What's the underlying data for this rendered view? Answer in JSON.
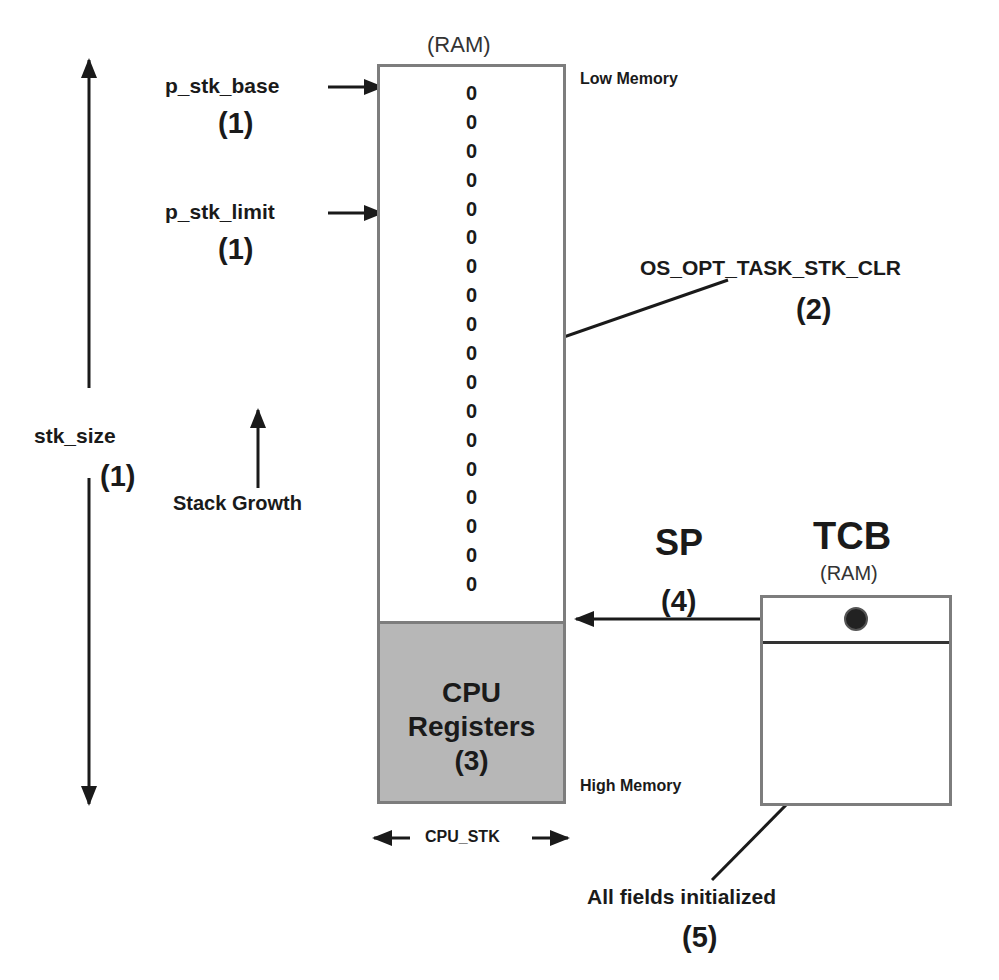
{
  "stack": {
    "ram_label": "(RAM)",
    "low_memory_label": "Low Memory",
    "high_memory_label": "High Memory",
    "zeros": [
      "0",
      "0",
      "0",
      "0",
      "0",
      "0",
      "0",
      "0",
      "0",
      "0",
      "0",
      "0",
      "0",
      "0",
      "0",
      "0",
      "0",
      "0"
    ],
    "registers_line1": "CPU",
    "registers_line2": "Registers",
    "registers_num": "(3)",
    "width_label": "CPU_STK"
  },
  "pointers": {
    "base_label": "p_stk_base",
    "base_num": "(1)",
    "limit_label": "p_stk_limit",
    "limit_num": "(1)"
  },
  "size": {
    "label": "stk_size",
    "num": "(1)"
  },
  "growth": {
    "label": "Stack Growth"
  },
  "clear_option": {
    "label": "OS_OPT_TASK_STK_CLR",
    "num": "(2)"
  },
  "sp": {
    "label": "SP",
    "num": "(4)"
  },
  "tcb": {
    "title": "TCB",
    "ram_label": "(RAM)",
    "fields_label": "All fields initialized",
    "fields_num": "(5)"
  },
  "colors": {
    "box_border": "#7d7d7d",
    "registers_fill": "#b7b7b7",
    "ink": "#1a1a1a"
  }
}
